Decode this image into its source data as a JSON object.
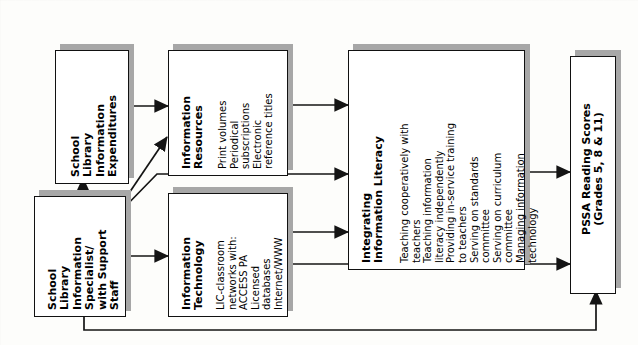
{
  "diagram": {
    "type": "flow-diagram",
    "orientation": "rotated-90-counterclockwise",
    "nodes": [
      {
        "id": "expenditures",
        "title": "School\nLibrary\nInformation\nExpenditures",
        "title_lines": [
          "School",
          "Library",
          "Information",
          "Expenditures"
        ],
        "items": []
      },
      {
        "id": "resources",
        "title_lines": [
          "Information",
          "Resources"
        ],
        "items": [
          "Print volumes",
          "Periodical",
          "subscriptions",
          "Electronic",
          "reference titles"
        ]
      },
      {
        "id": "specialist",
        "title_lines": [
          "School",
          "Library",
          "Information",
          "Specialist/",
          "with Support",
          "Staff"
        ],
        "items": []
      },
      {
        "id": "technology",
        "title_lines": [
          "Information",
          "Technology"
        ],
        "items": [
          "LIC-classroom",
          "networks with:",
          "ACCESS PA",
          "Licensed",
          "databases",
          "Internet/WWW"
        ]
      },
      {
        "id": "literacy",
        "title_lines": [
          "Integrating",
          "Information Literacy"
        ],
        "items": [
          "Teaching cooperatively with",
          "teachers",
          "Teaching information",
          "literacy independently",
          "Providing in-service training",
          "to teachers",
          "Serving on standards",
          "committee",
          "Serving on curriculum",
          "committee",
          "Managing information",
          "technology"
        ]
      },
      {
        "id": "scores",
        "title_lines": [
          "PSSA Reading Scores",
          "(Grades 5, 8 & 11)"
        ],
        "items": []
      }
    ],
    "edges": [
      {
        "from": "specialist",
        "to": "expenditures",
        "style": "arrow"
      },
      {
        "from": "expenditures",
        "to": "resources",
        "style": "arrow"
      },
      {
        "from": "specialist",
        "to": "resources",
        "style": "arrow-diagonal"
      },
      {
        "from": "specialist",
        "to": "technology",
        "style": "arrow"
      },
      {
        "from": "resources",
        "to": "literacy",
        "style": "arrow"
      },
      {
        "from": "specialist",
        "to": "literacy",
        "style": "arrow-diagonal"
      },
      {
        "from": "technology",
        "to": "literacy",
        "style": "arrow"
      },
      {
        "from": "literacy",
        "to": "scores",
        "style": "arrow"
      },
      {
        "from": "technology",
        "to": "scores",
        "style": "arrow"
      },
      {
        "from": "specialist",
        "to": "scores",
        "style": "arrow-routed-bottom"
      }
    ],
    "colors": {
      "box_fill": "#ffffff",
      "box_border": "#111111",
      "shadow": "#a7a7a7",
      "line": "#1a1a1a",
      "page": "#fdfdfb"
    }
  }
}
